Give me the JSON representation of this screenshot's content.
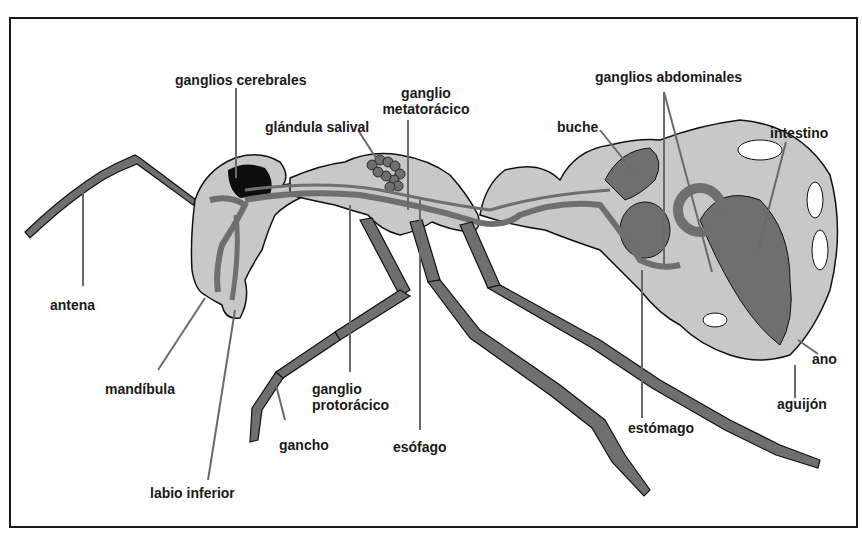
{
  "diagram": {
    "title": "",
    "colors": {
      "body_fill": "#c8c8c8",
      "organ_fill": "#6f6f6f",
      "dark_fill": "#0d0d0d",
      "outline": "#111111",
      "leader": "#6a6a6a",
      "frame": "#1a1a1a",
      "background": "#ffffff"
    },
    "labels": {
      "ganglios_cerebrales": "ganglios cerebrales",
      "ganglio_metatoracico_1": "ganglio",
      "ganglio_metatoracico_2": "metatorácico",
      "glandula_salival": "glándula salival",
      "buche": "buche",
      "ganglios_abdominales": "ganglios abdominales",
      "intestino": "intestino",
      "antena": "antena",
      "mandibula": "mandíbula",
      "ganglio_protoracico_1": "ganglio",
      "ganglio_protoracico_2": "protorácico",
      "gancho": "gancho",
      "esofago": "esófago",
      "labio_inferior": "labio inferior",
      "estomago": "estómago",
      "ano": "ano",
      "aguijon": "aguijón"
    }
  }
}
